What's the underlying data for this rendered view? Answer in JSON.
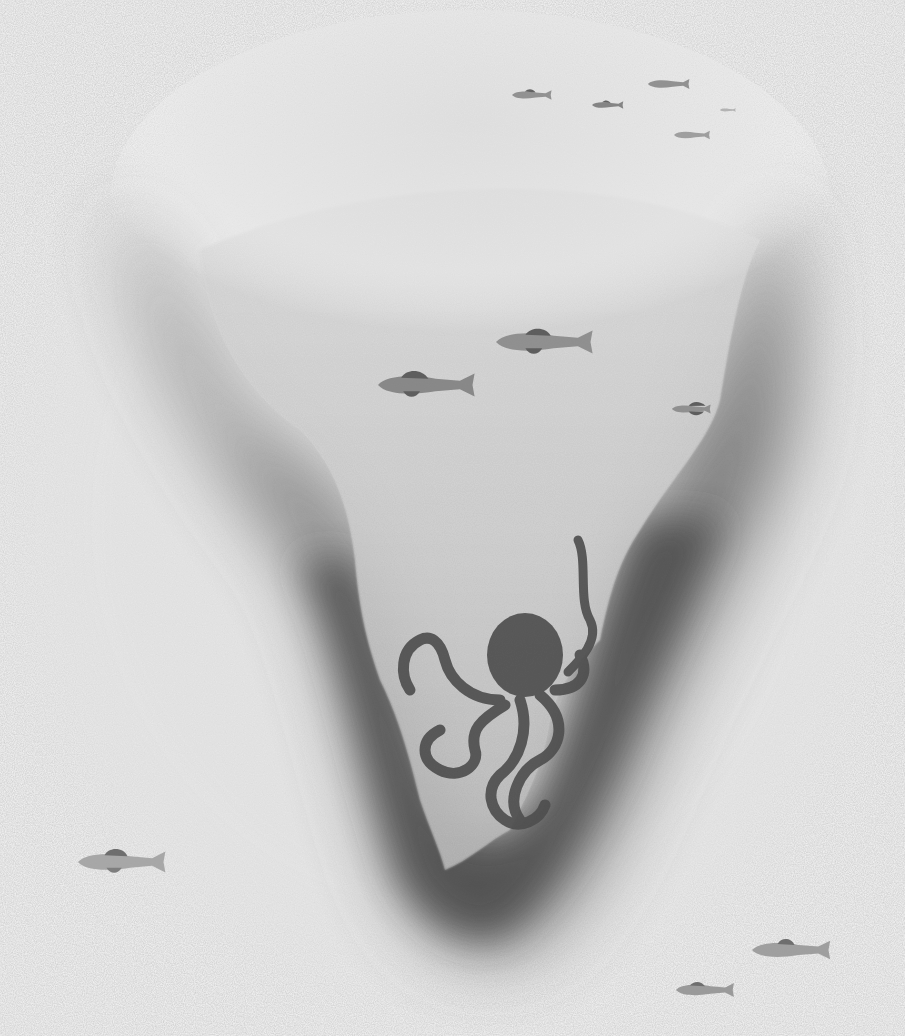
{
  "illustration": {
    "subject": "Underwater trench with fish and octopus",
    "style": "grayscale watercolor on textured paper",
    "colors": {
      "paper": "#f7f7f7",
      "water_light": "#d9d9d9",
      "trench_dark": "#4a4a4a",
      "fish": "#8a8a8a",
      "fish_fin": "#5a5a5a",
      "octopus": "#454545"
    },
    "fish": [
      {
        "x": 530,
        "y": 95,
        "len": 40,
        "shade": "#8c8c8c"
      },
      {
        "x": 607,
        "y": 105,
        "len": 32,
        "shade": "#7e7e7e"
      },
      {
        "x": 668,
        "y": 84,
        "len": 42,
        "shade": "#8c8c8c"
      },
      {
        "x": 692,
        "y": 135,
        "len": 36,
        "shade": "#9a9a9a"
      },
      {
        "x": 728,
        "y": 110,
        "len": 16,
        "shade": "#b0b0b0"
      },
      {
        "x": 544,
        "y": 342,
        "len": 98,
        "shade": "#8a8a8a"
      },
      {
        "x": 427,
        "y": 383,
        "len": 98,
        "shade": "#828282"
      },
      {
        "x": 693,
        "y": 409,
        "len": 34,
        "shade": "#8a8a8a"
      },
      {
        "x": 123,
        "y": 862,
        "len": 88,
        "shade": "#a0a0a0"
      },
      {
        "x": 790,
        "y": 950,
        "len": 78,
        "shade": "#9a9a9a"
      },
      {
        "x": 705,
        "y": 990,
        "len": 58,
        "shade": "#959595"
      }
    ],
    "octopus": {
      "x": 510,
      "y": 660,
      "color": "#454545"
    }
  }
}
